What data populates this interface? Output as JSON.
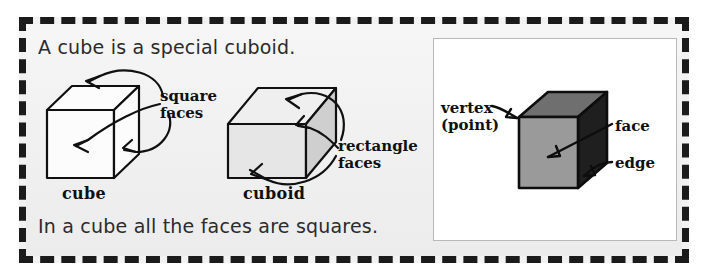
{
  "page": {
    "title": "A cube is a special cuboid",
    "background_color": "#f2f2f2",
    "frame_color": "#1b1b1b",
    "panel_color": "#ffffff"
  },
  "text": {
    "headline": "A cube is a special cuboid.",
    "footer": "In a cube all the faces are squares."
  },
  "left_panel": {
    "shapes": [
      {
        "name": "cube",
        "label": "cube",
        "fill": "#ffffff",
        "annotation": "square\nfaces"
      },
      {
        "name": "cuboid",
        "label": "cuboid",
        "fill": "#d9d9d9",
        "annotation": "rectangle\nfaces"
      }
    ],
    "annotations": {
      "square_faces_line1": "square",
      "square_faces_line2": "faces",
      "rectangle_faces_line1": "rectangle",
      "rectangle_faces_line2": "faces"
    }
  },
  "right_panel": {
    "shape": {
      "name": "shaded-cube",
      "front_fill": "#9a9a9a",
      "top_fill": "#6f6f6f",
      "side_fill": "#1f1f1f"
    },
    "callouts": [
      {
        "name": "vertex",
        "line1": "vertex",
        "line2": "(point)"
      },
      {
        "name": "face",
        "line1": "face"
      },
      {
        "name": "edge",
        "line1": "edge"
      }
    ]
  },
  "colors": {
    "ink": "#101010",
    "sentence_ink": "#2b2b2b",
    "cuboid_light": "#e6e6e6",
    "cuboid_mid": "#d2d2d2",
    "cuboid_dark": "#c4c4c4"
  }
}
